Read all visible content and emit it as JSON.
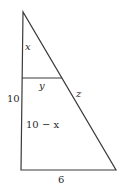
{
  "diagram": {
    "type": "geometry-similar-triangles",
    "colors": {
      "stroke": "#3a3a3a",
      "text": "#2a2a2a",
      "background": "#ffffff"
    },
    "vertices": {
      "top": [
        23,
        12
      ],
      "bottom_left": [
        21,
        170
      ],
      "bottom_right": [
        116,
        170
      ]
    },
    "inner_segment": {
      "from": [
        22,
        78
      ],
      "to": [
        62,
        78
      ]
    },
    "labels": {
      "upper_left_side": "x",
      "inner_segment": "y",
      "hypotenuse_lower": "z",
      "left_side_total": "10",
      "lower_left_side": "10 − x",
      "base": "6"
    }
  }
}
